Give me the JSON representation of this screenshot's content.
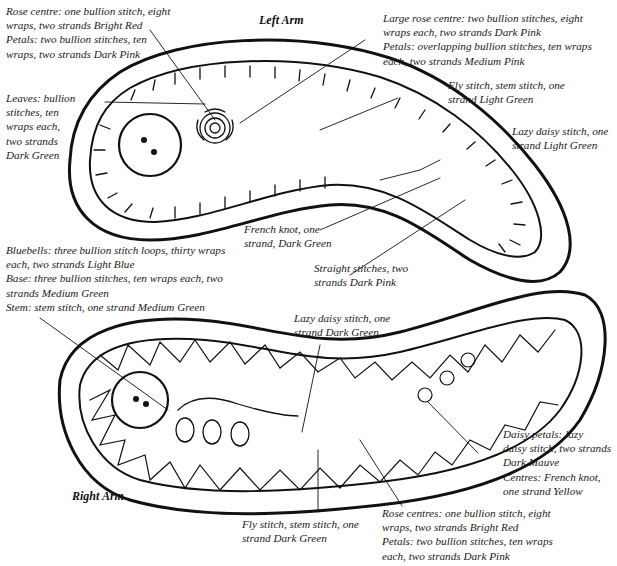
{
  "left_arm": {
    "title": "Left Arm",
    "labels": {
      "rose_centre": "Rose centre: one bullion stitch, eight\nwraps, two strands Bright Red\nPetals: two bullion stitches, ten\nwraps, two strands Dark Pink",
      "large_rose": "Large rose centre: two bullion stitches, eight\nwraps each, two strands Dark Pink\nPetals: overlapping bullion stitches, ten wraps\neach, two strands Medium Pink",
      "leaves": "Leaves: bullion\nstitches, ten\nwraps each,\ntwo strands\nDark Green",
      "fly_stitch": "Fly stitch, stem stitch, one\nstrand Light Green",
      "lazy_daisy": "Lazy daisy stitch, one\nstrand Light Green",
      "french_knot": "French knot, one\nstrand, Dark Green",
      "straight_stitches": "Straight stitches, two\nstrands Dark Pink"
    }
  },
  "right_arm": {
    "title": "Right Arm",
    "labels": {
      "bluebells": "Bluebells: three bullion stitch loops, thirty wraps\neach, two strands Light Blue\nBase: three bullion stitches, ten wraps each, two\nstrands Medium Green\nStem: stem stitch, one strand Medium Green",
      "lazy_daisy": "Lazy daisy stitch, one\nstrand Dark Green",
      "daisy_petals": "Daisy petals: lazy\ndaisy stitch, two strands\nDark Mauve\nCentres: French knot,\none strand Yellow",
      "fly_stitch": "Fly stitch, stem stitch, one\nstrand Dark Green",
      "rose_centres": "Rose centres: one bullion stitch, eight\nwraps, two strands Bright Red\nPetals: two bullion stitches, ten wraps\neach, two strands Dark Pink"
    }
  },
  "colors": {
    "ink": "#1a1a1a",
    "background": "#ffffff"
  }
}
